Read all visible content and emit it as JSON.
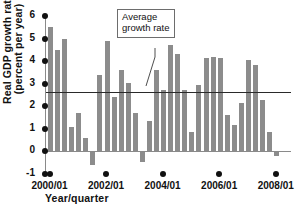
{
  "chart_data": {
    "type": "bar",
    "title": "",
    "xlabel": "Year/quarter",
    "ylabel_line1": "Real GDP growth rate",
    "ylabel_line2": "(percent per year)",
    "ylim": [
      -1,
      6
    ],
    "yticks": [
      6,
      5,
      4,
      3,
      2,
      1,
      0,
      -1
    ],
    "ytick_labels": [
      "6",
      "5",
      "4",
      "3",
      "2",
      "1",
      "0",
      "-1"
    ],
    "grid": false,
    "legend": "none",
    "annotations": [
      {
        "text_line1": "Average",
        "text_line2": "growth rate",
        "points_to_value": 2.65
      }
    ],
    "reference_lines": [
      {
        "name": "average-growth-rate",
        "value": 2.65,
        "color": "#2a2a2a"
      }
    ],
    "bar_color": "#8c8c8c",
    "xtick_labels": [
      "2000/Q1",
      "2002/Q1",
      "2004/Q1",
      "2006/Q1",
      "2008/Q1"
    ],
    "xtick_quarters": [
      0,
      8,
      16,
      24,
      32
    ],
    "categories": [
      "2000/Q1",
      "2000/Q2",
      "2000/Q3",
      "2000/Q4",
      "2001/Q1",
      "2001/Q2",
      "2001/Q3",
      "2001/Q4",
      "2002/Q1",
      "2002/Q2",
      "2002/Q3",
      "2002/Q4",
      "2003/Q1",
      "2003/Q2",
      "2003/Q3",
      "2003/Q4",
      "2004/Q1",
      "2004/Q2",
      "2004/Q3",
      "2004/Q4",
      "2005/Q1",
      "2005/Q2",
      "2005/Q3",
      "2005/Q4",
      "2006/Q1",
      "2006/Q2",
      "2006/Q3",
      "2006/Q4",
      "2007/Q1",
      "2007/Q2",
      "2007/Q3",
      "2007/Q4",
      "2008/Q1"
    ],
    "values": [
      5.5,
      4.5,
      5.0,
      1.1,
      1.7,
      0.6,
      -0.6,
      3.4,
      4.9,
      2.4,
      3.6,
      3.05,
      1.7,
      -0.45,
      1.35,
      3.6,
      2.7,
      4.7,
      4.3,
      2.7,
      0.85,
      2.95,
      4.15,
      4.2,
      4.15,
      1.6,
      1.15,
      2.15,
      4.05,
      3.85,
      2.3,
      0.85,
      -0.2
    ]
  }
}
